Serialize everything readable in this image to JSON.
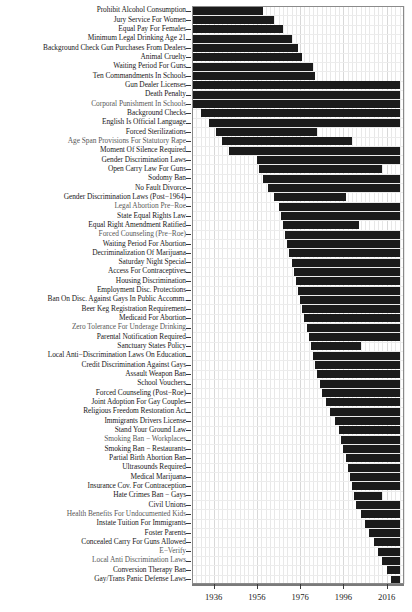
{
  "chart_data": {
    "type": "bar",
    "orientation": "horizontal",
    "title": "",
    "xlabel": "",
    "ylabel": "",
    "xlim": [
      1926,
      2024
    ],
    "grid": true,
    "legend": null,
    "bar_color": "#1b1b1b",
    "xticks": [
      1936,
      1956,
      1976,
      1996,
      2016
    ],
    "xticklabels": [
      "1936",
      "1956",
      "1976",
      "1996",
      "2016"
    ],
    "categories": [
      "Prohibit Alcohol Consumption",
      "Jury Service For Women",
      "Equal Pay For Females",
      "Minimum Legal Drinking Age 21",
      "Background Check Gun Purchases From Dealers",
      "Animal Cruelty",
      "Waiting Period For Guns",
      "Ten Commandments In Schools",
      "Gun Dealer Licenses",
      "Death Penalty",
      "Corporal Punishment In Schools",
      "Background Checks",
      "English Is Official Language",
      "Forced Sterilizations",
      "Age Span Provisions For Statutory Rape",
      "Moment Of Silence Required",
      "Gender Discrimination Laws",
      "Open Carry Law For Guns",
      "Sodomy Ban",
      "No Fault Divorce",
      "Gender Discrimination Laws (Post−1964)",
      "Legal Abortion Pre−Roe",
      "State Equal Rights Law",
      "Equal Right Amendment Ratified",
      "Forced Counseling (Pre−Roe)",
      "Waiting Period For Abortion",
      "Decriminalization Of Marijuana",
      "Saturday Night Special",
      "Access For Contraceptives",
      "Housing Discrimination",
      "Employment Disc. Protections",
      "Ban On Disc. Against Gays In Public Accomm.",
      "Beer Keg Registration Requirement",
      "Medicaid For Abortion",
      "Zero Tolerance For Underage Drinking",
      "Parental Notification Required",
      "Sanctuary States Policy",
      "Local Anti−Discrimination Laws On Education",
      "Credit Discrimination Against Gays",
      "Assault Weapon Ban",
      "School Vouchers",
      "Forced Counseling (Post−Roe)",
      "Joint Adoption For Gay Couples",
      "Religious Freedom Restoration Act",
      "Immigrants Drivers License",
      "Stand Your Ground Law",
      "Smoking Ban − Workplaces",
      "Smoking Ban − Restaurants",
      "Partial Birth Abortion Ban",
      "Ultrasounds Required",
      "Medical Marijuana",
      "Insurance Cov. For Contraception",
      "Hate Crimes Ban − Gays",
      "Civil Unions",
      "Health Benefits For Undocumented Kids",
      "Instate Tuition For Immigrants",
      "Foster Parents",
      "Concealed Carry For Guns Allowed",
      "E−Verify",
      "Local Anti Discrimination Laws",
      "Conversion Therapy Ban",
      "Gay/Trans Panic Defense Laws"
    ],
    "spans": [
      {
        "policy": "Prohibit Alcohol Consumption",
        "start": 1926,
        "end": 1959
      },
      {
        "policy": "Jury Service For Women",
        "start": 1926,
        "end": 1964
      },
      {
        "policy": "Equal Pay For Females",
        "start": 1926,
        "end": 1968
      },
      {
        "policy": "Minimum Legal Drinking Age 21",
        "start": 1926,
        "end": 1972
      },
      {
        "policy": "Background Check Gun Purchases From Dealers",
        "start": 1926,
        "end": 1975
      },
      {
        "policy": "Animal Cruelty",
        "start": 1926,
        "end": 1977
      },
      {
        "policy": "Waiting Period For Guns",
        "start": 1926,
        "end": 1982
      },
      {
        "policy": "Ten Commandments In Schools",
        "start": 1926,
        "end": 1983
      },
      {
        "policy": "Gun Dealer Licenses",
        "start": 1926,
        "end": 2022
      },
      {
        "policy": "Death Penalty",
        "start": 1926,
        "end": 2022
      },
      {
        "policy": "Corporal Punishment In Schools",
        "start": 1926,
        "end": 2022
      },
      {
        "policy": "Background Checks",
        "start": 1930,
        "end": 2022
      },
      {
        "policy": "English Is Official Language",
        "start": 1934,
        "end": 2022
      },
      {
        "policy": "Forced Sterilizations",
        "start": 1937,
        "end": 1984
      },
      {
        "policy": "Age Span Provisions For Statutory Rape",
        "start": 1940,
        "end": 2000
      },
      {
        "policy": "Moment Of Silence Required",
        "start": 1943,
        "end": 2022
      },
      {
        "policy": "Gender Discrimination Laws",
        "start": 1956,
        "end": 2022
      },
      {
        "policy": "Open Carry Law For Guns",
        "start": 1957,
        "end": 2014
      },
      {
        "policy": "Sodomy Ban",
        "start": 1959,
        "end": 2022
      },
      {
        "policy": "No Fault Divorce",
        "start": 1961,
        "end": 2022
      },
      {
        "policy": "Gender Discrimination Laws (Post−1964)",
        "start": 1964,
        "end": 1997
      },
      {
        "policy": "Legal Abortion Pre−Roe",
        "start": 1966,
        "end": 2022
      },
      {
        "policy": "State Equal Rights Law",
        "start": 1967,
        "end": 2022
      },
      {
        "policy": "Equal Right Amendment Ratified",
        "start": 1968,
        "end": 2003
      },
      {
        "policy": "Forced Counseling (Pre−Roe)",
        "start": 1969,
        "end": 2022
      },
      {
        "policy": "Waiting Period For Abortion",
        "start": 1970,
        "end": 2022
      },
      {
        "policy": "Decriminalization Of Marijuana",
        "start": 1971,
        "end": 2022
      },
      {
        "policy": "Saturday Night Special",
        "start": 1972,
        "end": 2022
      },
      {
        "policy": "Access For Contraceptives",
        "start": 1973,
        "end": 2022
      },
      {
        "policy": "Housing Discrimination",
        "start": 1974,
        "end": 2022
      },
      {
        "policy": "Employment Disc. Protections",
        "start": 1975,
        "end": 2022
      },
      {
        "policy": "Ban On Disc. Against Gays In Public Accomm.",
        "start": 1976,
        "end": 2022
      },
      {
        "policy": "Beer Keg Registration Requirement",
        "start": 1977,
        "end": 2022
      },
      {
        "policy": "Medicaid For Abortion",
        "start": 1978,
        "end": 2022
      },
      {
        "policy": "Zero Tolerance For Underage Drinking",
        "start": 1979,
        "end": 2022
      },
      {
        "policy": "Parental Notification Required",
        "start": 1980,
        "end": 2022
      },
      {
        "policy": "Sanctuary States Policy",
        "start": 1981,
        "end": 2004
      },
      {
        "policy": "Local Anti−Discrimination Laws On Education",
        "start": 1982,
        "end": 2022
      },
      {
        "policy": "Credit Discrimination Against Gays",
        "start": 1983,
        "end": 2022
      },
      {
        "policy": "Assault Weapon Ban",
        "start": 1984,
        "end": 2022
      },
      {
        "policy": "School Vouchers",
        "start": 1985,
        "end": 2022
      },
      {
        "policy": "Forced Counseling (Post−Roe)",
        "start": 1986,
        "end": 2022
      },
      {
        "policy": "Joint Adoption For Gay Couples",
        "start": 1988,
        "end": 2022
      },
      {
        "policy": "Religious Freedom Restoration Act",
        "start": 1990,
        "end": 2022
      },
      {
        "policy": "Immigrants Drivers License",
        "start": 1992,
        "end": 2022
      },
      {
        "policy": "Stand Your Ground Law",
        "start": 1994,
        "end": 2022
      },
      {
        "policy": "Smoking Ban − Workplaces",
        "start": 1995,
        "end": 2022
      },
      {
        "policy": "Smoking Ban − Restaurants",
        "start": 1996,
        "end": 2022
      },
      {
        "policy": "Partial Birth Abortion Ban",
        "start": 1997,
        "end": 2022
      },
      {
        "policy": "Ultrasounds Required",
        "start": 1998,
        "end": 2022
      },
      {
        "policy": "Medical Marijuana",
        "start": 1999,
        "end": 2022
      },
      {
        "policy": "Insurance Cov. For Contraception",
        "start": 2000,
        "end": 2022
      },
      {
        "policy": "Hate Crimes Ban − Gays",
        "start": 2001,
        "end": 2014
      },
      {
        "policy": "Civil Unions",
        "start": 2002,
        "end": 2022
      },
      {
        "policy": "Health Benefits For Undocumented Kids",
        "start": 2004,
        "end": 2022
      },
      {
        "policy": "Instate Tuition For Immigrants",
        "start": 2006,
        "end": 2022
      },
      {
        "policy": "Foster Parents",
        "start": 2008,
        "end": 2022
      },
      {
        "policy": "Concealed Carry For Guns Allowed",
        "start": 2010,
        "end": 2022
      },
      {
        "policy": "E−Verify",
        "start": 2012,
        "end": 2022
      },
      {
        "policy": "Local Anti Discrimination Laws",
        "start": 2014,
        "end": 2022
      },
      {
        "policy": "Conversion Therapy Ban",
        "start": 2016,
        "end": 2022
      },
      {
        "policy": "Gay/Trans Panic Defense Laws",
        "start": 2018,
        "end": 2022
      }
    ],
    "faded_labels": [
      "Age Span Provisions For Statutory Rape",
      "Legal Abortion Pre−Roe",
      "Forced Counseling (Pre−Roe)",
      "Zero Tolerance For Underage Drinking",
      "Smoking Ban − Workplaces",
      "Health Benefits For Undocumented Kids",
      "E−Verify",
      "Local Anti Discrimination Laws",
      "Corporal Punishment In Schools"
    ]
  }
}
